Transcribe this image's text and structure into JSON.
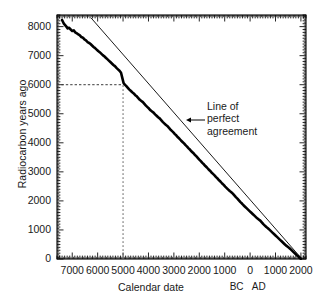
{
  "chart_data": {
    "type": "line",
    "title": "",
    "xlabel": "Calendar date",
    "ylabel": "Radiocarbon years ago",
    "xlim": [
      -7600,
      2200
    ],
    "ylim": [
      0,
      8400
    ],
    "grid": false,
    "legend_position": "none",
    "x_tick_labels": [
      "7000",
      "6000",
      "5000",
      "4000",
      "3000",
      "2000",
      "1000",
      "0",
      "1000",
      "2000"
    ],
    "x_tick_values": [
      -7000,
      -6000,
      -5000,
      -4000,
      -3000,
      -2000,
      -1000,
      0,
      1000,
      2000
    ],
    "y_tick_labels": [
      "0",
      "1000",
      "2000",
      "3000",
      "4000",
      "5000",
      "6000",
      "7000",
      "8000"
    ],
    "y_tick_values": [
      0,
      1000,
      2000,
      3000,
      4000,
      5000,
      6000,
      7000,
      8000
    ],
    "era_labels": [
      {
        "text": "BC",
        "value": -450
      },
      {
        "text": "AD",
        "value": 420
      }
    ],
    "annotations": [
      {
        "text_lines": [
          "Line of",
          "perfect",
          "agreement"
        ],
        "x": -1150,
        "y": 5050,
        "arrow": "left"
      }
    ],
    "series": [
      {
        "name": "Radiocarbon calibration curve",
        "style": "thick-wiggly",
        "color": "#000000",
        "points": [
          [
            -7400,
            8230
          ],
          [
            -7330,
            8100
          ],
          [
            -7280,
            8050
          ],
          [
            -7230,
            8000
          ],
          [
            -7180,
            7940
          ],
          [
            -7120,
            7960
          ],
          [
            -7060,
            7900
          ],
          [
            -7000,
            7850
          ],
          [
            -6940,
            7870
          ],
          [
            -6880,
            7800
          ],
          [
            -6820,
            7770
          ],
          [
            -6760,
            7730
          ],
          [
            -6700,
            7700
          ],
          [
            -6640,
            7640
          ],
          [
            -6580,
            7620
          ],
          [
            -6520,
            7560
          ],
          [
            -6460,
            7530
          ],
          [
            -6400,
            7470
          ],
          [
            -6340,
            7440
          ],
          [
            -6280,
            7400
          ],
          [
            -6220,
            7350
          ],
          [
            -6160,
            7300
          ],
          [
            -6100,
            7260
          ],
          [
            -6040,
            7210
          ],
          [
            -5980,
            7160
          ],
          [
            -5920,
            7120
          ],
          [
            -5860,
            7070
          ],
          [
            -5800,
            7020
          ],
          [
            -5740,
            6980
          ],
          [
            -5680,
            6930
          ],
          [
            -5620,
            6880
          ],
          [
            -5560,
            6830
          ],
          [
            -5500,
            6780
          ],
          [
            -5440,
            6730
          ],
          [
            -5380,
            6680
          ],
          [
            -5320,
            6640
          ],
          [
            -5260,
            6580
          ],
          [
            -5200,
            6530
          ],
          [
            -5140,
            6480
          ],
          [
            -5080,
            6410
          ],
          [
            -5020,
            6200
          ],
          [
            -4980,
            6060
          ],
          [
            -4940,
            6010
          ],
          [
            -4880,
            5960
          ],
          [
            -4820,
            5900
          ],
          [
            -4760,
            5840
          ],
          [
            -4700,
            5790
          ],
          [
            -4640,
            5740
          ],
          [
            -4580,
            5700
          ],
          [
            -4520,
            5640
          ],
          [
            -4460,
            5600
          ],
          [
            -4400,
            5540
          ],
          [
            -4340,
            5480
          ],
          [
            -4280,
            5440
          ],
          [
            -4220,
            5400
          ],
          [
            -4160,
            5340
          ],
          [
            -4100,
            5280
          ],
          [
            -4040,
            5230
          ],
          [
            -3980,
            5180
          ],
          [
            -3920,
            5120
          ],
          [
            -3860,
            5080
          ],
          [
            -3800,
            5040
          ],
          [
            -3740,
            4980
          ],
          [
            -3680,
            4930
          ],
          [
            -3620,
            4880
          ],
          [
            -3560,
            4840
          ],
          [
            -3500,
            4780
          ],
          [
            -3440,
            4720
          ],
          [
            -3380,
            4670
          ],
          [
            -3320,
            4620
          ],
          [
            -3260,
            4580
          ],
          [
            -3200,
            4520
          ],
          [
            -3140,
            4460
          ],
          [
            -3080,
            4410
          ],
          [
            -3020,
            4360
          ],
          [
            -2960,
            4300
          ],
          [
            -2900,
            4250
          ],
          [
            -2840,
            4190
          ],
          [
            -2780,
            4140
          ],
          [
            -2720,
            4080
          ],
          [
            -2660,
            4030
          ],
          [
            -2600,
            3980
          ],
          [
            -2540,
            3920
          ],
          [
            -2480,
            3870
          ],
          [
            -2420,
            3810
          ],
          [
            -2360,
            3760
          ],
          [
            -2300,
            3700
          ],
          [
            -2240,
            3650
          ],
          [
            -2180,
            3590
          ],
          [
            -2120,
            3540
          ],
          [
            -2060,
            3480
          ],
          [
            -2000,
            3420
          ],
          [
            -1940,
            3370
          ],
          [
            -1880,
            3310
          ],
          [
            -1820,
            3260
          ],
          [
            -1760,
            3200
          ],
          [
            -1700,
            3150
          ],
          [
            -1640,
            3090
          ],
          [
            -1580,
            3040
          ],
          [
            -1520,
            2980
          ],
          [
            -1460,
            2930
          ],
          [
            -1400,
            2880
          ],
          [
            -1340,
            2820
          ],
          [
            -1280,
            2770
          ],
          [
            -1220,
            2710
          ],
          [
            -1160,
            2660
          ],
          [
            -1100,
            2600
          ],
          [
            -1040,
            2550
          ],
          [
            -980,
            2490
          ],
          [
            -920,
            2440
          ],
          [
            -860,
            2390
          ],
          [
            -800,
            2340
          ],
          [
            -740,
            2300
          ],
          [
            -680,
            2250
          ],
          [
            -620,
            2190
          ],
          [
            -560,
            2130
          ],
          [
            -500,
            2080
          ],
          [
            -440,
            2020
          ],
          [
            -380,
            1960
          ],
          [
            -320,
            1910
          ],
          [
            -260,
            1850
          ],
          [
            -200,
            1800
          ],
          [
            -140,
            1750
          ],
          [
            -80,
            1700
          ],
          [
            -20,
            1650
          ],
          [
            40,
            1600
          ],
          [
            100,
            1550
          ],
          [
            160,
            1500
          ],
          [
            220,
            1450
          ],
          [
            280,
            1400
          ],
          [
            340,
            1360
          ],
          [
            400,
            1320
          ],
          [
            460,
            1260
          ],
          [
            520,
            1200
          ],
          [
            580,
            1150
          ],
          [
            640,
            1100
          ],
          [
            700,
            1060
          ],
          [
            760,
            1010
          ],
          [
            820,
            960
          ],
          [
            880,
            910
          ],
          [
            940,
            860
          ],
          [
            1000,
            810
          ],
          [
            1060,
            760
          ],
          [
            1120,
            710
          ],
          [
            1180,
            660
          ],
          [
            1240,
            610
          ],
          [
            1300,
            560
          ],
          [
            1360,
            510
          ],
          [
            1420,
            460
          ],
          [
            1480,
            420
          ],
          [
            1540,
            380
          ],
          [
            1600,
            330
          ],
          [
            1660,
            280
          ],
          [
            1720,
            230
          ],
          [
            1780,
            180
          ],
          [
            1840,
            130
          ],
          [
            1900,
            90
          ],
          [
            1960,
            40
          ],
          [
            2000,
            10
          ]
        ]
      },
      {
        "name": "Line of perfect agreement",
        "style": "thin-straight",
        "color": "#000000",
        "points": [
          [
            -6260,
            8300
          ],
          [
            2010,
            30
          ]
        ]
      }
    ],
    "reference_lines": [
      {
        "orientation": "horizontal",
        "value": 6000,
        "style": "dashed",
        "from_x": -7600,
        "to_x": -5010
      },
      {
        "orientation": "vertical",
        "value": -5000,
        "style": "dashed",
        "from_y": 0,
        "to_y": 6050
      }
    ]
  },
  "axis_titles": {
    "y": "Radiocarbon years ago",
    "x": "Calendar date"
  }
}
